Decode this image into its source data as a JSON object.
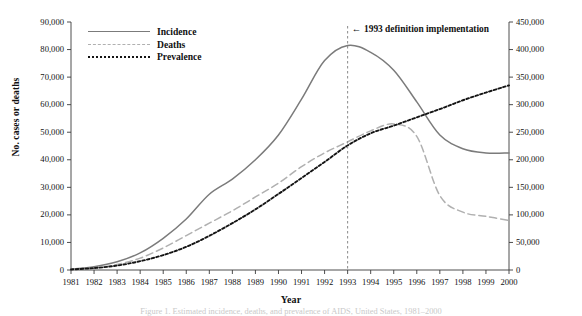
{
  "chart_data": {
    "type": "line",
    "title": "",
    "xlabel": "Year",
    "ylabel": "No. cases or deaths",
    "ylabel_right": "No. persons living with AIDS",
    "xlim": [
      1981,
      2000
    ],
    "ylim": [
      0,
      90000
    ],
    "ylim_right": [
      0,
      450000
    ],
    "grid": false,
    "legend_position": "top-left",
    "x": [
      1981,
      1982,
      1983,
      1984,
      1985,
      1986,
      1987,
      1988,
      1989,
      1990,
      1991,
      1992,
      1993,
      1994,
      1995,
      1996,
      1997,
      1998,
      1999,
      2000
    ],
    "xticklabels": [
      "1981",
      "1982",
      "1983",
      "1984",
      "1985",
      "1986",
      "1987",
      "1988",
      "1989",
      "1990",
      "1991",
      "1992",
      "1993",
      "1994",
      "1995",
      "1996",
      "1997",
      "1998",
      "1999",
      "2000"
    ],
    "yticklabels_left": [
      "0",
      "10,000",
      "20,000",
      "30,000",
      "40,000",
      "50,000",
      "60,000",
      "70,000",
      "80,000",
      "90,000"
    ],
    "ytickvalues_left": [
      0,
      10000,
      20000,
      30000,
      40000,
      50000,
      60000,
      70000,
      80000,
      90000
    ],
    "yticklabels_right": [
      "0",
      "50,000",
      "100,000",
      "150,000",
      "200,000",
      "250,000",
      "300,000",
      "350,000",
      "400,000",
      "450,000"
    ],
    "ytickvalues_right": [
      0,
      50000,
      100000,
      150000,
      200000,
      250000,
      300000,
      350000,
      400000,
      450000
    ],
    "series": [
      {
        "name": "Incidence",
        "axis": "left",
        "color": "#7b7b7b",
        "style": "solid",
        "values": [
          300,
          1200,
          3000,
          6200,
          11500,
          18500,
          27500,
          33000,
          40000,
          49000,
          62000,
          76000,
          81500,
          79000,
          72500,
          61000,
          49000,
          44000,
          42500,
          42500
        ]
      },
      {
        "name": "Deaths",
        "axis": "left",
        "color": "#b0b0b0",
        "style": "dashed",
        "values": [
          200,
          800,
          2000,
          4300,
          8000,
          12500,
          17000,
          21500,
          26500,
          31500,
          37500,
          42500,
          46500,
          50500,
          53000,
          48500,
          27000,
          21000,
          19500,
          18000
        ]
      },
      {
        "name": "Prevalence",
        "axis": "right",
        "color": "#141414",
        "style": "dotted",
        "values": [
          1000,
          3500,
          8000,
          16000,
          27000,
          42000,
          62000,
          85000,
          110000,
          138000,
          167000,
          196000,
          226000,
          248000,
          262000,
          277000,
          292000,
          308000,
          322000,
          335000
        ]
      }
    ],
    "annotations": [
      {
        "name": "definition-change",
        "text": "1993 definition implementation",
        "arrow": "←",
        "x": 1993,
        "line_style": "dashed-vertical"
      }
    ]
  },
  "legend": {
    "items": [
      {
        "label": "Incidence"
      },
      {
        "label": "Deaths"
      },
      {
        "label": "Prevalence"
      }
    ]
  },
  "caption": {
    "text": "Figure 1. Estimated incidence, deaths, and prevalence of AIDS, United States, 1981–2000"
  }
}
